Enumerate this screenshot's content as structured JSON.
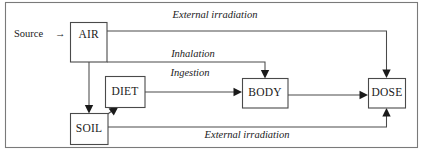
{
  "figure": {
    "type": "flow-diagram",
    "title_visible": false,
    "frame": {
      "present": true,
      "color": "#7a7a7a"
    },
    "colors": {
      "box_stroke": "#4a4a4a",
      "line_stroke": "#4a4a4a",
      "arrow_fill": "#1a1a1a",
      "text": "#1a1a1a",
      "background": "#ffffff"
    },
    "source": {
      "label": "Source",
      "arrow_glyph": "→"
    },
    "nodes": [
      {
        "id": "air",
        "label": "AIR"
      },
      {
        "id": "diet",
        "label": "DIET"
      },
      {
        "id": "soil",
        "label": "SOIL"
      },
      {
        "id": "body",
        "label": "BODY"
      },
      {
        "id": "dose",
        "label": "DOSE"
      }
    ],
    "edges": [
      {
        "id": "air-dose-ext",
        "from": "AIR",
        "to": "DOSE",
        "label": "External irradiation"
      },
      {
        "id": "air-body-inh",
        "from": "AIR",
        "to": "BODY",
        "label": "Inhalation"
      },
      {
        "id": "diet-body-ing",
        "from": "DIET",
        "to": "BODY",
        "label": "Ingestion"
      },
      {
        "id": "soil-dose-ext",
        "from": "SOIL",
        "to": "DOSE",
        "label": "External irradiation"
      },
      {
        "id": "air-soil",
        "from": "AIR",
        "to": "SOIL",
        "label": ""
      },
      {
        "id": "soil-diet",
        "from": "SOIL",
        "to": "DIET",
        "label": ""
      },
      {
        "id": "body-dose",
        "from": "BODY",
        "to": "DOSE",
        "label": ""
      }
    ]
  }
}
